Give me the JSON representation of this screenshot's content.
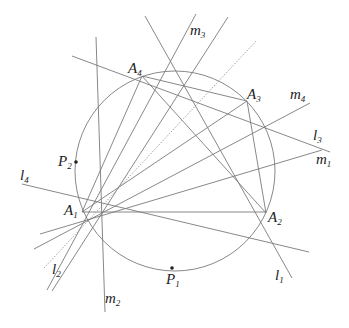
{
  "diagram": {
    "circle": {
      "cx": 175,
      "cy": 171,
      "r": 100
    },
    "points": [
      {
        "name": "A",
        "sub": "1",
        "x": 82,
        "y": 210,
        "lx": 64,
        "ly": 215
      },
      {
        "name": "A",
        "sub": "2",
        "x": 266,
        "y": 213,
        "lx": 268,
        "ly": 222
      },
      {
        "name": "A",
        "sub": "3",
        "x": 247,
        "y": 101,
        "lx": 247,
        "ly": 99
      },
      {
        "name": "A",
        "sub": "4",
        "x": 142,
        "y": 76,
        "lx": 128,
        "ly": 73
      },
      {
        "name": "P",
        "sub": "1",
        "x": 172,
        "y": 268,
        "lx": 166,
        "ly": 284
      },
      {
        "name": "P",
        "sub": "2",
        "x": 76,
        "y": 162,
        "lx": 58,
        "ly": 166
      }
    ],
    "lines": [
      {
        "name": "l",
        "sub": "1",
        "x1": 145,
        "y1": 16,
        "x2": 292,
        "y2": 278,
        "lx": 275,
        "ly": 280
      },
      {
        "name": "l",
        "sub": "2",
        "x1": 47,
        "y1": 290,
        "x2": 196,
        "y2": 14,
        "lx": 52,
        "ly": 274
      },
      {
        "name": "l",
        "sub": "3",
        "x1": 72,
        "y1": 56,
        "x2": 330,
        "y2": 152,
        "lx": 313,
        "ly": 140
      },
      {
        "name": "l",
        "sub": "4",
        "x1": 22,
        "y1": 184,
        "x2": 309,
        "y2": 252,
        "lx": 20,
        "ly": 180
      },
      {
        "name": "m",
        "sub": "1",
        "x1": 40,
        "y1": 234,
        "x2": 322,
        "y2": 150,
        "lx": 316,
        "ly": 164
      },
      {
        "name": "m",
        "sub": "2",
        "x1": 96,
        "y1": 37,
        "x2": 105,
        "y2": 312,
        "lx": 105,
        "ly": 303
      },
      {
        "name": "m",
        "sub": "3",
        "x1": 52,
        "y1": 291,
        "x2": 228,
        "y2": 17,
        "lx": 190,
        "ly": 35
      },
      {
        "name": "m",
        "sub": "4",
        "x1": 34,
        "y1": 249,
        "x2": 310,
        "y2": 103,
        "lx": 290,
        "ly": 99
      }
    ],
    "chords": [
      {
        "x1": 82,
        "y1": 212,
        "x2": 266,
        "y2": 212
      },
      {
        "x1": 142,
        "y1": 76,
        "x2": 266,
        "y2": 213
      },
      {
        "x1": 247,
        "y1": 101,
        "x2": 266,
        "y2": 213
      },
      {
        "x1": 142,
        "y1": 76,
        "x2": 247,
        "y2": 101
      },
      {
        "x1": 82,
        "y1": 212,
        "x2": 247,
        "y2": 101
      },
      {
        "x1": 82,
        "y1": 212,
        "x2": 142,
        "y2": 76
      }
    ],
    "dotted_line": {
      "x1": 44,
      "y1": 268,
      "x2": 257,
      "y2": 40
    }
  }
}
